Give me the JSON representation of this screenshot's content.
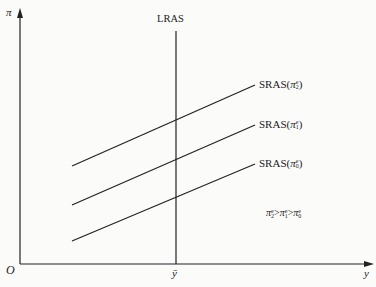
{
  "diagram": {
    "type": "economics-aggregate-supply",
    "axes": {
      "y_label": "π",
      "x_label": "y",
      "origin_label": "O",
      "x_tick_label": "ȳ"
    },
    "lras": {
      "label": "LRAS"
    },
    "sras_curves": [
      {
        "label_prefix": "SRAS(",
        "symbol": "π",
        "superscript": "e",
        "subscript": "2",
        "label_suffix": ")"
      },
      {
        "label_prefix": "SRAS(",
        "symbol": "π",
        "superscript": "e",
        "subscript": "1",
        "label_suffix": ")"
      },
      {
        "label_prefix": "SRAS(",
        "symbol": "π",
        "superscript": "e",
        "subscript": "0",
        "label_suffix": ")"
      }
    ],
    "note": {
      "terms": [
        {
          "symbol": "π",
          "superscript": "e",
          "subscript": "2"
        },
        {
          "symbol": "π",
          "superscript": "e",
          "subscript": "1"
        },
        {
          "symbol": "π",
          "superscript": "e",
          "subscript": "0"
        }
      ],
      "operator": ">"
    },
    "colors": {
      "line": "#222222",
      "background": "#fbfbfa"
    }
  }
}
